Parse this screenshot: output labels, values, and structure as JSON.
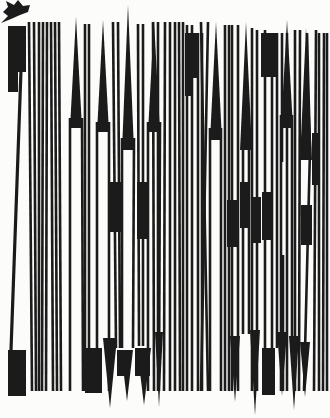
{
  "meta": {
    "width": 330,
    "height": 418,
    "background_color": "#fcfcfa",
    "ink_color": "#1b1b1b"
  },
  "cursor": {
    "points": "1,23 8,16 3,12 8,7 6,1 14,5 18,0 23,6 30,5 28,12 20,15 11,19"
  },
  "glyph_field": {
    "stems": [
      [
        29,
        22,
        32,
        391
      ],
      [
        34,
        22,
        36,
        391
      ],
      [
        39,
        22,
        39,
        391
      ],
      [
        43,
        22,
        42,
        391
      ],
      [
        47,
        22,
        46,
        391
      ],
      [
        51,
        22,
        53,
        391
      ],
      [
        55,
        22,
        57,
        391
      ],
      [
        59,
        22,
        61,
        391
      ],
      [
        70,
        118,
        70,
        391
      ],
      [
        82,
        118,
        83,
        391
      ],
      [
        85,
        24,
        85,
        391
      ],
      [
        89,
        24,
        89,
        391
      ],
      [
        97,
        122,
        97,
        391
      ],
      [
        109,
        122,
        109,
        391
      ],
      [
        113,
        22,
        116,
        348
      ],
      [
        118,
        22,
        120,
        348
      ],
      [
        122,
        138,
        122,
        348
      ],
      [
        134,
        138,
        133,
        348
      ],
      [
        138,
        24,
        139,
        346
      ],
      [
        143,
        24,
        143,
        346
      ],
      [
        148,
        122,
        148,
        391
      ],
      [
        160,
        122,
        159,
        391
      ],
      [
        153,
        22,
        154,
        391
      ],
      [
        158,
        22,
        158,
        391
      ],
      [
        165,
        22,
        164,
        391
      ],
      [
        170,
        22,
        170,
        391
      ],
      [
        175,
        22,
        175,
        391
      ],
      [
        179,
        22,
        180,
        391
      ],
      [
        183,
        22,
        183,
        391
      ],
      [
        187,
        25,
        187,
        391
      ],
      [
        192,
        25,
        192,
        391
      ],
      [
        198,
        33,
        198,
        391
      ],
      [
        202,
        33,
        202,
        391
      ],
      [
        201,
        22,
        208,
        391
      ],
      [
        208,
        22,
        201,
        391
      ],
      [
        210,
        128,
        210,
        391
      ],
      [
        221,
        128,
        221,
        391
      ],
      [
        225,
        25,
        225,
        391
      ],
      [
        229,
        25,
        229,
        391
      ],
      [
        232,
        25,
        232,
        391
      ],
      [
        238,
        25,
        238,
        391
      ],
      [
        243,
        138,
        243,
        334
      ],
      [
        249,
        138,
        249,
        334
      ],
      [
        252,
        28,
        252,
        391
      ],
      [
        257,
        30,
        257,
        391
      ],
      [
        265,
        30,
        265,
        391
      ],
      [
        272,
        33,
        272,
        391
      ],
      [
        277,
        33,
        277,
        348
      ],
      [
        282,
        33,
        282,
        162
      ],
      [
        283,
        255,
        283,
        391
      ],
      [
        287,
        33,
        287,
        391
      ],
      [
        281,
        115,
        281,
        391
      ],
      [
        292,
        115,
        292,
        350
      ],
      [
        295,
        30,
        295,
        391
      ],
      [
        300,
        30,
        299,
        391
      ],
      [
        307,
        33,
        310,
        150
      ],
      [
        310,
        150,
        304,
        391
      ],
      [
        316,
        30,
        314,
        391
      ],
      [
        319,
        33,
        319,
        391
      ],
      [
        324,
        33,
        323,
        391
      ],
      [
        327,
        33,
        327,
        391
      ]
    ],
    "diagonals": [
      [
        21,
        70,
        11,
        350,
        3.2
      ]
    ],
    "rects": [
      [
        8,
        26,
        18,
        46
      ],
      [
        8,
        68,
        10,
        24
      ],
      [
        8,
        350,
        18,
        46
      ],
      [
        185,
        33,
        13,
        45
      ],
      [
        185,
        76,
        7,
        20
      ],
      [
        261,
        33,
        15,
        44
      ],
      [
        110,
        182,
        12,
        50
      ],
      [
        137,
        182,
        11,
        57
      ],
      [
        227,
        200,
        11,
        47
      ],
      [
        240,
        182,
        8,
        46
      ],
      [
        253,
        197,
        8,
        46
      ],
      [
        262,
        192,
        9,
        48
      ],
      [
        301,
        205,
        11,
        40
      ],
      [
        312,
        133,
        8,
        52
      ],
      [
        85,
        348,
        17,
        45
      ],
      [
        262,
        348,
        13,
        47
      ],
      [
        117,
        350,
        13,
        26
      ],
      [
        135,
        348,
        15,
        28
      ]
    ],
    "wedges_up": [
      [
        76,
        17,
        6,
        128
      ],
      [
        103,
        20,
        6,
        132
      ],
      [
        128,
        5,
        6,
        150
      ],
      [
        154,
        20,
        6,
        132
      ],
      [
        216,
        22,
        6,
        140
      ],
      [
        246,
        22,
        6,
        150
      ],
      [
        287,
        20,
        6,
        128
      ],
      [
        306,
        28,
        6,
        160
      ]
    ],
    "wedges_down": [
      [
        110,
        408,
        7,
        338
      ],
      [
        127,
        401,
        6,
        350
      ],
      [
        144,
        405,
        7,
        348
      ],
      [
        159,
        407,
        4,
        332
      ],
      [
        235,
        402,
        5,
        336
      ],
      [
        255,
        415,
        5,
        330
      ],
      [
        282,
        396,
        5,
        332
      ],
      [
        294,
        410,
        5,
        336
      ],
      [
        305,
        397,
        5,
        342
      ]
    ]
  }
}
